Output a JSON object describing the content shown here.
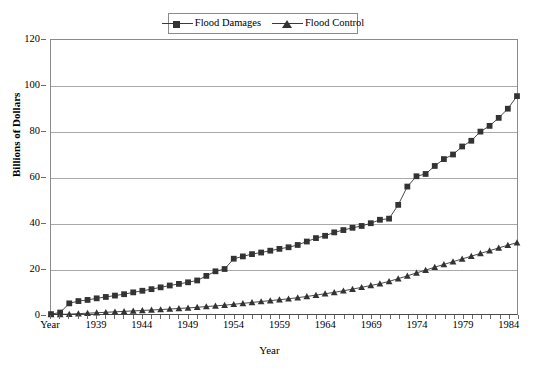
{
  "chart_data": {
    "type": "line",
    "title": "",
    "xlabel": "Year",
    "ylabel": "Billions of Dollars",
    "ylim": [
      0,
      120
    ],
    "ytick_values": [
      0,
      20,
      40,
      60,
      80,
      100,
      120
    ],
    "xlim": [
      1934,
      1985
    ],
    "xtick_labels": [
      "Year",
      "1939",
      "1944",
      "1949",
      "1954",
      "1959",
      "1964",
      "1969",
      "1974",
      "1979",
      "1984"
    ],
    "xtick_years": [
      1934,
      1939,
      1944,
      1949,
      1954,
      1959,
      1964,
      1969,
      1974,
      1979,
      1984
    ],
    "grid": "horizontal",
    "legend_position": "top-center",
    "x": [
      1934,
      1935,
      1936,
      1937,
      1938,
      1939,
      1940,
      1941,
      1942,
      1943,
      1944,
      1945,
      1946,
      1947,
      1948,
      1949,
      1950,
      1951,
      1952,
      1953,
      1954,
      1955,
      1956,
      1957,
      1958,
      1959,
      1960,
      1961,
      1962,
      1963,
      1964,
      1965,
      1966,
      1967,
      1968,
      1969,
      1970,
      1971,
      1972,
      1973,
      1974,
      1975,
      1976,
      1977,
      1978,
      1979,
      1980,
      1981,
      1982,
      1983,
      1984,
      1985
    ],
    "series": [
      {
        "name": "Flood Damages",
        "marker": "square",
        "color": "#333333",
        "values": [
          0.3,
          1.0,
          5.0,
          6.0,
          6.5,
          7.2,
          7.8,
          8.4,
          9.0,
          9.8,
          10.5,
          11.2,
          12.0,
          12.8,
          13.5,
          14.2,
          15.0,
          17.0,
          19.0,
          20.0,
          24.5,
          25.5,
          26.5,
          27.2,
          28.0,
          28.8,
          29.5,
          30.5,
          32.0,
          33.5,
          34.5,
          36.0,
          37.0,
          38.0,
          38.8,
          40.0,
          41.5,
          42.0,
          48.0,
          56.0,
          60.5,
          61.5,
          65.0,
          68.0,
          70.0,
          73.5,
          76.0,
          80.0,
          82.5,
          86.0,
          90.0,
          95.5
        ]
      },
      {
        "name": "Flood Control",
        "marker": "triangle",
        "color": "#333333",
        "values": [
          0.1,
          0.2,
          0.3,
          0.5,
          0.7,
          0.9,
          1.1,
          1.3,
          1.5,
          1.7,
          1.9,
          2.1,
          2.3,
          2.5,
          2.8,
          3.0,
          3.3,
          3.6,
          3.9,
          4.2,
          4.6,
          5.0,
          5.4,
          5.8,
          6.2,
          6.6,
          7.0,
          7.5,
          8.0,
          8.6,
          9.2,
          9.8,
          10.5,
          11.2,
          12.0,
          12.8,
          13.6,
          14.6,
          15.8,
          17.0,
          18.3,
          19.5,
          20.8,
          22.0,
          23.2,
          24.4,
          25.6,
          26.8,
          28.0,
          29.2,
          30.4,
          31.5
        ]
      }
    ]
  }
}
